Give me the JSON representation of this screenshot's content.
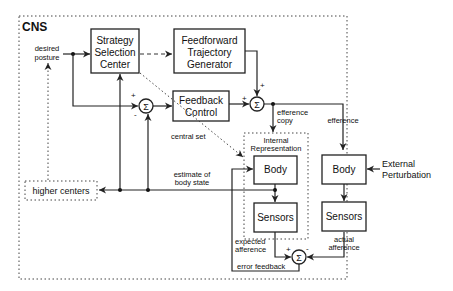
{
  "diagram": {
    "title": "CNS",
    "nodes": {
      "strategy": [
        "Strategy",
        "Selection",
        "Center"
      ],
      "feedforward": [
        "Feedforward",
        "Trajectory",
        "Generator"
      ],
      "feedback": [
        "Feedback",
        "Control"
      ],
      "internal_rep": [
        "Internal",
        "Representation"
      ],
      "body_internal": "Body",
      "sensors_internal": "Sensors",
      "body_external": "Body",
      "sensors_external": "Sensors",
      "higher_centers": "higher centers",
      "sum_symbol": "Σ"
    },
    "labels": {
      "desired_posture": [
        "desired",
        "posture"
      ],
      "central_set": "central set",
      "efference_copy": [
        "efference",
        "copy"
      ],
      "efference": "efference",
      "estimate": [
        "estimate of",
        "body state"
      ],
      "external_perturbation": [
        "External",
        "Perturbation"
      ],
      "expected_afference": [
        "expected",
        "afference"
      ],
      "actual_afference": [
        "actual",
        "afference"
      ],
      "error_feedback": "error feedback",
      "plus": "+",
      "minus": "-"
    }
  }
}
